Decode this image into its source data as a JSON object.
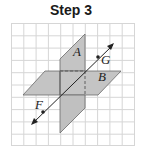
{
  "title": "Step 3",
  "diagram": {
    "grid": {
      "x0": 11,
      "y0": 23,
      "cols": 10,
      "rows": 10,
      "cell": 12.3,
      "color": "#d6d6d6"
    },
    "planes": [
      {
        "label": "A",
        "orientation": "vertical",
        "fill": "#c4c4c4"
      },
      {
        "label": "B",
        "orientation": "horizontal",
        "fill": "#c4c4c4"
      }
    ],
    "line": {
      "points": [
        "F",
        "G"
      ],
      "description": "line FG intersecting the planes with arrows at both ends"
    },
    "labels": {
      "plane_a": "A",
      "plane_b": "B",
      "point_f": "F",
      "point_g": "G"
    }
  }
}
